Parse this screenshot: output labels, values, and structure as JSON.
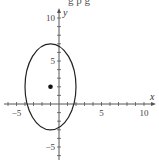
{
  "chart_data": {
    "type": "line",
    "title": "",
    "cropped_title_fragment": "g p g",
    "xlabel": "x",
    "ylabel": "y",
    "xlim": [
      -7,
      11
    ],
    "ylim": [
      -7,
      11
    ],
    "grid": false,
    "legend": null,
    "x_ticks": [
      -5,
      5,
      10
    ],
    "y_ticks": [
      -5,
      5,
      10
    ],
    "x_tick_labels": [
      "-5",
      "5",
      "10"
    ],
    "y_tick_labels": [
      "-5",
      "5",
      "10"
    ],
    "minor_tick_step": 1,
    "series": [
      {
        "name": "ellipse",
        "kind": "ellipse",
        "equation": "(x+1)^2/9 + (y-2)^2/25 = 1",
        "center": [
          -1,
          2
        ],
        "semi_axis_x": 3,
        "semi_axis_y": 5,
        "color": "#222222"
      },
      {
        "name": "center point",
        "kind": "point",
        "x": -1,
        "y": 2,
        "color": "#111111"
      }
    ]
  },
  "axes": {
    "x_label": "x",
    "y_label": "y"
  },
  "colors": {
    "axis": "#555555",
    "curve": "#222222",
    "point": "#111111"
  }
}
